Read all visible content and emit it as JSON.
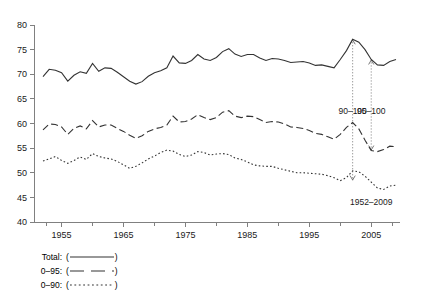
{
  "chart_data": {
    "type": "line",
    "title": "",
    "subtitle": "",
    "xlabel": "",
    "ylabel": "",
    "xlim": [
      1952,
      2009
    ],
    "ylim": [
      40,
      80
    ],
    "grid": false,
    "legend_position": "below-left",
    "x_ticks_major": [
      1955,
      1965,
      1975,
      1985,
      1995,
      2005
    ],
    "x_ticks_minor": [
      1960,
      1970,
      1980,
      1990,
      2000
    ],
    "y_ticks": [
      40,
      45,
      50,
      55,
      60,
      65,
      70,
      75,
      80
    ],
    "x": [
      1952,
      1953,
      1954,
      1955,
      1956,
      1957,
      1958,
      1959,
      1960,
      1961,
      1962,
      1963,
      1964,
      1965,
      1966,
      1967,
      1968,
      1969,
      1970,
      1971,
      1972,
      1973,
      1974,
      1975,
      1976,
      1977,
      1978,
      1979,
      1980,
      1981,
      1982,
      1983,
      1984,
      1985,
      1986,
      1987,
      1988,
      1989,
      1990,
      1991,
      1992,
      1993,
      1994,
      1995,
      1996,
      1997,
      1998,
      1999,
      2000,
      2001,
      2002,
      2003,
      2004,
      2005,
      2006,
      2007,
      2008,
      2009
    ],
    "series": [
      {
        "name": "Total",
        "style": "solid",
        "values": [
          69.5,
          71.0,
          70.8,
          70.3,
          68.6,
          69.8,
          70.5,
          70.2,
          72.2,
          70.6,
          71.3,
          71.2,
          70.4,
          69.5,
          68.6,
          68.0,
          68.5,
          69.6,
          70.3,
          70.7,
          71.3,
          73.7,
          72.3,
          72.2,
          72.8,
          74.0,
          73.1,
          72.8,
          73.4,
          74.6,
          75.2,
          74.1,
          73.6,
          74.0,
          74.0,
          73.3,
          72.8,
          73.2,
          73.1,
          72.8,
          72.4,
          72.5,
          72.6,
          72.3,
          71.8,
          71.9,
          71.6,
          71.3,
          73.0,
          74.8,
          77.1,
          76.5,
          75.0,
          73.0,
          71.9,
          71.8,
          72.6,
          73.0
        ]
      },
      {
        "name": "0–95",
        "style": "dashed",
        "values": [
          58.7,
          59.9,
          59.8,
          59.3,
          57.8,
          59.0,
          59.5,
          58.9,
          60.6,
          59.3,
          59.7,
          59.7,
          59.0,
          58.4,
          57.6,
          57.0,
          57.5,
          58.4,
          58.9,
          59.2,
          59.7,
          61.5,
          60.3,
          60.4,
          60.9,
          61.8,
          61.2,
          60.8,
          61.2,
          62.3,
          62.6,
          61.5,
          61.2,
          61.5,
          61.4,
          60.8,
          60.2,
          60.4,
          60.3,
          59.9,
          59.3,
          59.2,
          59.0,
          58.6,
          58.0,
          57.8,
          57.3,
          56.8,
          57.8,
          59.2,
          60.2,
          58.9,
          56.6,
          54.5,
          54.3,
          54.7,
          55.4,
          55.3
        ]
      },
      {
        "name": "0–90",
        "style": "dotted",
        "values": [
          52.4,
          52.8,
          53.3,
          52.5,
          51.9,
          52.5,
          53.2,
          52.7,
          53.9,
          53.3,
          53.0,
          52.8,
          52.3,
          51.6,
          50.9,
          51.3,
          52.0,
          52.8,
          53.4,
          54.1,
          54.6,
          54.4,
          53.7,
          53.3,
          53.6,
          54.3,
          54.1,
          53.6,
          53.8,
          53.9,
          53.7,
          53.0,
          52.7,
          52.2,
          51.6,
          51.4,
          51.3,
          51.3,
          50.9,
          50.6,
          50.3,
          50.0,
          50.0,
          49.9,
          49.8,
          49.7,
          49.4,
          49.0,
          48.4,
          49.0,
          50.4,
          50.2,
          49.3,
          48.1,
          46.9,
          46.6,
          47.3,
          47.5
        ]
      }
    ],
    "annotations": [
      {
        "id": "annot-90-100",
        "text": "90–100",
        "x": 2002,
        "y": 62.0
      },
      {
        "id": "annot-95-100",
        "text": "95–100",
        "x": 2005,
        "y": 62.0
      },
      {
        "id": "annot-period",
        "text": "1952–2009",
        "x": 2005,
        "y": 43.5
      }
    ],
    "leaders": [
      {
        "id": "leader-90-100",
        "x": 2002,
        "y_from": 48.4,
        "y_to": 77.1
      },
      {
        "id": "leader-95-100",
        "x": 2005,
        "y_from": 54.5,
        "y_to": 73.0
      }
    ]
  },
  "legend": {
    "items": [
      {
        "label": "Total:",
        "sample": "(————)",
        "style": "solid"
      },
      {
        "label": "0–95:",
        "sample": "(—  —)",
        "style": "dashed"
      },
      {
        "label": "0–90:",
        "sample": "(······)",
        "style": "dotted"
      }
    ]
  }
}
